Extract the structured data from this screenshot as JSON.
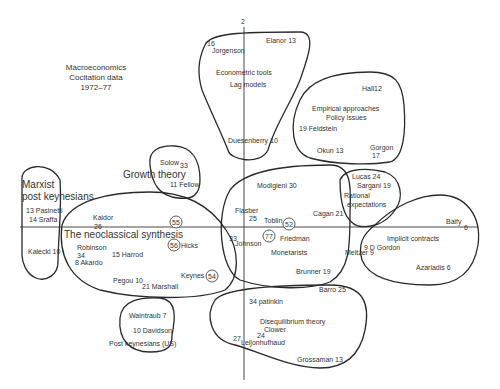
{
  "title": {
    "line1": "Macroeconomics",
    "line2": "Cocitation data",
    "line3": "1972–77"
  },
  "axes": {
    "vertical_label": "2",
    "horizontal_label": "6"
  },
  "clusters": {
    "econometric": {
      "name1": "Econometric tools",
      "name2": "Lag models",
      "authors": [
        "16",
        "Jorgenson",
        "Elanor 13",
        "Duesenberry 10"
      ]
    },
    "empirical": {
      "name1": "Empirical approaches",
      "name2": "Policy issues",
      "authors": [
        "Hall12",
        "19 Feldstein",
        "Okun 13",
        "Gorgon",
        "17"
      ]
    },
    "marxist": {
      "name1": "Marxist",
      "name2": "post keynesians",
      "authors": [
        "13 Pasinetti",
        "14 Sraffa",
        "Kalecki 10"
      ]
    },
    "growth": {
      "name": "Growth theory",
      "authors": [
        "Solow",
        "33",
        "11 Fellow"
      ]
    },
    "neoclassical": {
      "name": "The neoclassical synthesis",
      "authors": [
        "Kaidor",
        "26",
        "55",
        "Robinson",
        "34",
        "8 Akardo",
        "15 Harrod",
        "56",
        "Hicks",
        "Pegou 10",
        "21 Marshall",
        "Keynes",
        "54"
      ]
    },
    "monetarists": {
      "name": "Monetarists",
      "authors": [
        "Modigieni 30",
        "Flasber",
        "25",
        "Toblin",
        "52",
        "Cagan 21",
        "33",
        "Johnson",
        "77",
        "Friedman",
        "Meltzer 9",
        "Brunner 19"
      ]
    },
    "rational": {
      "name1": "Rational",
      "name2": "expectations",
      "authors": [
        "Lucas 24",
        "Sargani 19"
      ]
    },
    "implicit": {
      "name": "Implicit contracts",
      "authors": [
        "Baify",
        "9 D Gordon",
        "Azariadis 6"
      ]
    },
    "postkeynesians_us": {
      "name": "Post keynesians (US)",
      "authors": [
        "Waintraub 7",
        "10 Davidson"
      ]
    },
    "disequilibrium": {
      "name": "Disequilibrium theory",
      "authors": [
        "Barro 25",
        "34 patinkin",
        "Clower",
        "24",
        "27",
        "Leijonhufhaud",
        "Grossaman 13"
      ]
    }
  }
}
